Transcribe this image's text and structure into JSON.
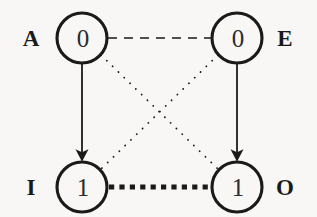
{
  "diagram": {
    "background_color": "#f8f7f5",
    "stroke_color": "#1a1a1a",
    "nodes": [
      {
        "id": "A",
        "label": "A",
        "value": "0",
        "position": "top-left",
        "cx": 82,
        "cy": 38,
        "r": 25,
        "label_side": "left"
      },
      {
        "id": "E",
        "label": "E",
        "value": "0",
        "position": "top-right",
        "cx": 237,
        "cy": 38,
        "r": 25,
        "label_side": "right"
      },
      {
        "id": "I",
        "label": "I",
        "value": "1",
        "position": "bottom-left",
        "cx": 82,
        "cy": 187,
        "r": 25,
        "label_side": "left"
      },
      {
        "id": "O",
        "label": "O",
        "value": "1",
        "position": "bottom-right",
        "cx": 237,
        "cy": 187,
        "r": 25,
        "label_side": "right"
      }
    ],
    "edges": [
      {
        "from": "A",
        "to": "E",
        "style": "dashed",
        "arrow": false,
        "width": 1.6,
        "name": "edge-a-e-dashed"
      },
      {
        "from": "I",
        "to": "O",
        "style": "thick-dotted",
        "arrow": false,
        "width": 5.0,
        "name": "edge-i-o-thick-dotted"
      },
      {
        "from": "A",
        "to": "I",
        "style": "solid",
        "arrow": true,
        "width": 1.8,
        "name": "edge-a-i-solid-arrow"
      },
      {
        "from": "E",
        "to": "O",
        "style": "solid",
        "arrow": true,
        "width": 1.8,
        "name": "edge-e-o-solid-arrow"
      },
      {
        "from": "A",
        "to": "O",
        "style": "dotted",
        "arrow": false,
        "width": 1.5,
        "name": "edge-a-o-dotted-diagonal"
      },
      {
        "from": "E",
        "to": "I",
        "style": "dotted",
        "arrow": false,
        "width": 1.5,
        "name": "edge-e-i-dotted-diagonal"
      }
    ]
  }
}
